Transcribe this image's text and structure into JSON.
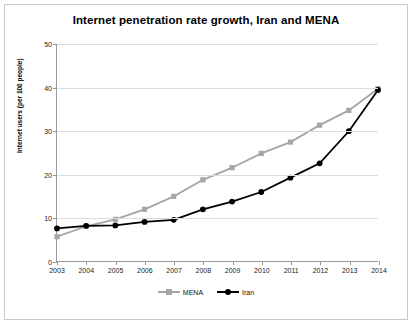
{
  "chart_data": {
    "type": "line",
    "title": "Internet penetration rate growth, Iran and MENA",
    "xlabel": "",
    "ylabel": "Internet users (per 100 people)",
    "categories": [
      "2003",
      "2004",
      "2005",
      "2006",
      "2007",
      "2008",
      "2009",
      "2010",
      "2011",
      "2012",
      "2013",
      "2014"
    ],
    "xlim": [
      "2003",
      "2014"
    ],
    "ylim": [
      0,
      50
    ],
    "yticks": [
      0,
      10,
      20,
      30,
      40,
      50
    ],
    "grid": true,
    "legend_position": "bottom",
    "series": [
      {
        "name": "MENA",
        "color": "#a6a6a6",
        "marker": "square",
        "values": [
          5.6,
          8.0,
          9.6,
          11.9,
          14.9,
          18.7,
          21.5,
          24.8,
          27.4,
          31.3,
          34.7,
          39.7
        ]
      },
      {
        "name": "Iran",
        "color": "#000000",
        "marker": "circle",
        "values": [
          7.5,
          8.1,
          8.2,
          9.0,
          9.5,
          11.9,
          13.7,
          15.9,
          19.2,
          22.5,
          29.9,
          39.4
        ]
      }
    ]
  },
  "legend": [
    {
      "label": "MENA"
    },
    {
      "label": "Iran"
    }
  ]
}
